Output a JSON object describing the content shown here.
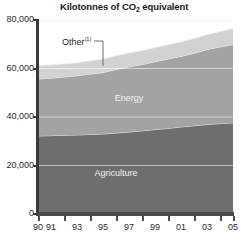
{
  "chart_data": {
    "type": "area",
    "stacked": true,
    "title": "Kilotonnes of CO2 equivalent",
    "title_main": "Kilotonnes of CO",
    "title_sub": "2",
    "title_tail": " equivalent",
    "xlabel": "",
    "ylabel": "",
    "ylim": [
      0,
      80000
    ],
    "grid": true,
    "legend_position": "inline-labels",
    "x": [
      1990,
      1991,
      1992,
      1993,
      1994,
      1995,
      1996,
      1997,
      1998,
      1999,
      2000,
      2001,
      2002,
      2003,
      2004,
      2005
    ],
    "categories": [
      "90",
      "91",
      "92",
      "93",
      "94",
      "95",
      "96",
      "97",
      "98",
      "99",
      "00",
      "01",
      "02",
      "03",
      "04",
      "05"
    ],
    "xtick_labels": [
      "90",
      "91",
      "93",
      "95",
      "97",
      "99",
      "01",
      "03",
      "05"
    ],
    "xtick_years": [
      1990,
      1991,
      1993,
      1995,
      1997,
      1999,
      2001,
      2003,
      2005
    ],
    "ytick_labels": [
      "0",
      "20,000",
      "40,000",
      "60,000",
      "80,000"
    ],
    "ytick_values": [
      0,
      20000,
      40000,
      60000,
      80000
    ],
    "series": [
      {
        "name": "Agriculture",
        "color": "#6e6e6e",
        "values": [
          32200,
          32300,
          32500,
          32600,
          32800,
          33000,
          33400,
          33800,
          34300,
          34800,
          35300,
          35900,
          36400,
          36900,
          37300,
          37600
        ]
      },
      {
        "name": "Energy",
        "color": "#a3a3a3",
        "values": [
          23500,
          23700,
          24000,
          24400,
          24900,
          25300,
          26200,
          26900,
          27300,
          28000,
          28600,
          29100,
          29900,
          30900,
          31600,
          32200
        ]
      },
      {
        "name": "Other",
        "color": "#d2d2d2",
        "values": [
          5600,
          5500,
          5400,
          5400,
          5500,
          5600,
          5700,
          5700,
          5800,
          5900,
          5900,
          6000,
          6100,
          6200,
          6400,
          6700
        ]
      }
    ],
    "totals": [
      61300,
      61500,
      61900,
      62400,
      63200,
      63900,
      65300,
      66400,
      67400,
      68700,
      69800,
      71000,
      72400,
      74000,
      75300,
      76500
    ],
    "annotations": [
      {
        "name": "other-callout",
        "text": "Other",
        "superscript": "(1)",
        "points_to_series": "Other",
        "points_to_year": 1995
      }
    ],
    "band_labels": [
      {
        "name": "Energy",
        "year": 1997
      },
      {
        "name": "Agriculture",
        "year": 1996
      }
    ],
    "colors": {
      "agriculture": "#6e6e6e",
      "energy": "#a3a3a3",
      "other": "#d2d2d2",
      "gridline": "#ededed",
      "axis": "#3a3a3a",
      "text": "#2b2b2b",
      "band_label_text": "#f2f2f2",
      "background": "#ffffff"
    }
  }
}
